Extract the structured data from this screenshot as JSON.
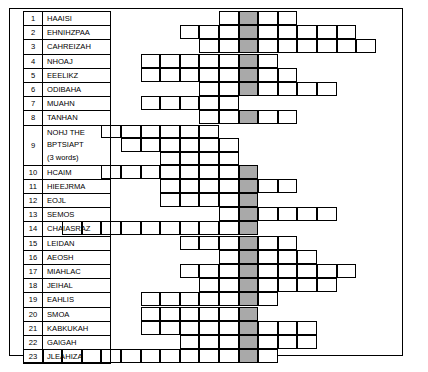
{
  "puzzle": {
    "title": "acrostic-word-grid-puzzle",
    "shaded_column_index": 11,
    "colors": {
      "border": "#000000",
      "cell_fill": "#ffffff",
      "shaded_fill": "#a9a9a9",
      "page_background": "#ffffff"
    },
    "grid": {
      "columns": 20,
      "rows": 23,
      "cell_width": 19.6,
      "cell_height": 13.33
    }
  },
  "clues": [
    {
      "number": "1",
      "text": "HAAISI",
      "start": 10,
      "length": 4,
      "tall": false
    },
    {
      "number": "2",
      "text": "EHNIHZPAA",
      "start": 8,
      "length": 9,
      "tall": false
    },
    {
      "number": "3",
      "text": "CAHREIZAH",
      "start": 9,
      "length": 9,
      "tall": false
    },
    {
      "number": "4",
      "text": "NHOAJ",
      "start": 6,
      "length": 7,
      "tall": false
    },
    {
      "number": "5",
      "text": "EEELIKZ",
      "start": 6,
      "length": 8,
      "tall": false
    },
    {
      "number": "6",
      "text": "ODIBAHA",
      "start": 9,
      "length": 7,
      "tall": false
    },
    {
      "number": "7",
      "text": "MUAHN",
      "start": 6,
      "length": 5,
      "tall": false
    },
    {
      "number": "8",
      "text": "TANHAN",
      "start": 9,
      "length": 5,
      "tall": false
    },
    {
      "number": "9",
      "text": "NOHJ THE\nBPTSIAPT\n(3 words)",
      "start": 4,
      "length": 16,
      "tall": true
    },
    {
      "number": "10",
      "text": "HCAIM",
      "start": 4,
      "length": 8,
      "tall": false
    },
    {
      "number": "11",
      "text": "HIEEJRMA",
      "start": 7,
      "length": 7,
      "tall": false
    },
    {
      "number": "12",
      "text": "EOJL",
      "start": 7,
      "length": 5,
      "tall": false
    },
    {
      "number": "13",
      "text": "SEMOS",
      "start": 10,
      "length": 6,
      "tall": false
    },
    {
      "number": "14",
      "text": "CHAIASRAZ",
      "start": 2,
      "length": 10,
      "tall": false
    },
    {
      "number": "15",
      "text": "LEIDAN",
      "start": 8,
      "length": 6,
      "tall": false
    },
    {
      "number": "16",
      "text": "AEOSH",
      "start": 10,
      "length": 5,
      "tall": false
    },
    {
      "number": "17",
      "text": "MIAHLAC",
      "start": 8,
      "length": 9,
      "tall": false
    },
    {
      "number": "18",
      "text": "JEIHAL",
      "start": 9,
      "length": 7,
      "tall": false
    },
    {
      "number": "19",
      "text": "EAHLIS",
      "start": 6,
      "length": 7,
      "tall": false
    },
    {
      "number": "20",
      "text": "SMOA",
      "start": 6,
      "length": 6,
      "tall": false
    },
    {
      "number": "21",
      "text": "KABKUKAH",
      "start": 6,
      "length": 9,
      "tall": false
    },
    {
      "number": "22",
      "text": "GAIGAH",
      "start": 8,
      "length": 7,
      "tall": false
    },
    {
      "number": "23",
      "text": "JLEAHIZA",
      "start": 0,
      "length": 13,
      "tall": false
    }
  ]
}
